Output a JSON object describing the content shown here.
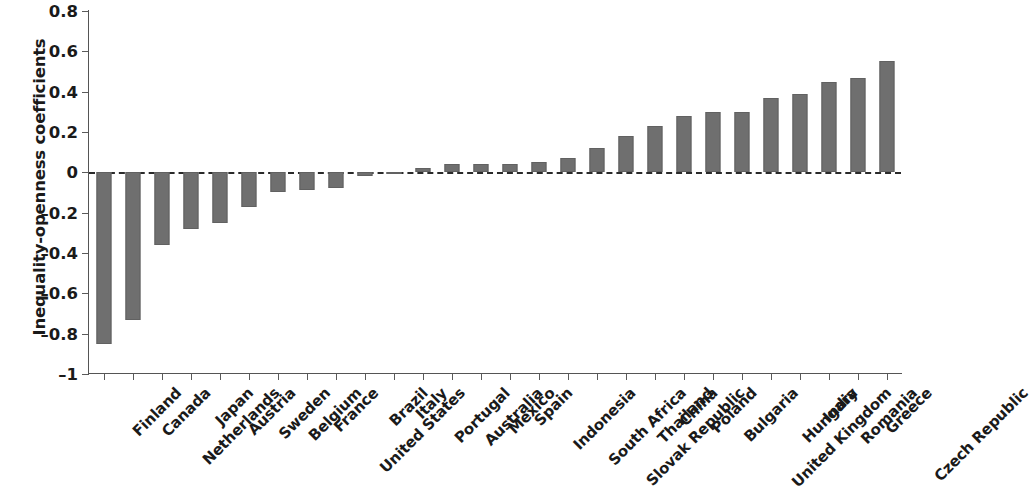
{
  "chart_data": {
    "type": "bar",
    "title": "",
    "xlabel": "",
    "ylabel": "Inequality-openness coefficients",
    "ylim": [
      -1,
      0.8
    ],
    "yticks": [
      0.8,
      0.6,
      0.4,
      0.2,
      0,
      -0.2,
      -0.4,
      -0.6,
      -0.8,
      -1
    ],
    "ytick_labels": [
      "0.8",
      "0.6",
      "0.4",
      "0.2",
      "0",
      "–0.2",
      "–0.4",
      "–0.6",
      "–0.8",
      "–1"
    ],
    "grid": false,
    "legend": null,
    "zero_reference_line": true,
    "bar_color": "#6f6f6f",
    "categories": [
      "Finland",
      "Canada",
      "Netherlands",
      "Japan",
      "Austria",
      "Sweden",
      "Belgium",
      "France",
      "United States",
      "Brazil",
      "Italy",
      "Portugal",
      "Australia",
      "Mexico",
      "Spain",
      "Indonesia",
      "South Africa",
      "Slovak Republic",
      "Thailand",
      "China",
      "Poland",
      "Bulgaria",
      "United Kingdom",
      "Hungary",
      "India",
      "Romania",
      "Greece",
      "Czech Republic"
    ],
    "values": [
      -0.85,
      -0.73,
      -0.36,
      -0.28,
      -0.25,
      -0.17,
      -0.1,
      -0.09,
      -0.08,
      -0.02,
      -0.01,
      0.02,
      0.04,
      0.04,
      0.04,
      0.05,
      0.07,
      0.12,
      0.18,
      0.23,
      0.28,
      0.3,
      0.3,
      0.37,
      0.39,
      0.45,
      0.47,
      0.55
    ]
  }
}
